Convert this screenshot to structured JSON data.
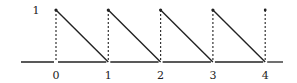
{
  "figure": {
    "y_label": "1",
    "x_tick_labels": [
      "0",
      "1",
      "2",
      "3",
      "4"
    ],
    "colors": {
      "line": "#222222",
      "dashed": "#333333",
      "background": "#ffffff"
    }
  },
  "chart_data": {
    "type": "line",
    "title": "",
    "xlabel": "",
    "ylabel": "",
    "x_ticks": [
      0,
      1,
      2,
      3,
      4
    ],
    "y_ticks": [
      1
    ],
    "segments": [
      {
        "from": [
          0,
          1
        ],
        "to": [
          1,
          0
        ]
      },
      {
        "from": [
          1,
          1
        ],
        "to": [
          2,
          0
        ]
      },
      {
        "from": [
          2,
          1
        ],
        "to": [
          3,
          0
        ]
      },
      {
        "from": [
          3,
          1
        ],
        "to": [
          4,
          0
        ]
      }
    ],
    "dashed_verticals_at": [
      0,
      1,
      2,
      3,
      4
    ],
    "isolated_points": [
      [
        4,
        1
      ]
    ],
    "xlim": [
      -0.7,
      4.35
    ],
    "ylim": [
      0,
      1
    ]
  }
}
